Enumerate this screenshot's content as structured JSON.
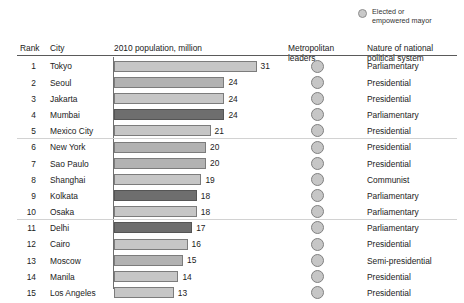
{
  "legend": {
    "icon": "filled-circle-icon",
    "label": "Elected or\nempowered mayor",
    "swatch_color": "#c9c9c9"
  },
  "header": {
    "rank": "Rank",
    "city": "City",
    "population": "2010 population, million",
    "metropolitan_leaders": "Metropolitan\nleaders",
    "political_system": "Nature of national\npolitical system"
  },
  "colors": {
    "bar_light": "#c6c6c6",
    "bar_medium": "#b2b2b2",
    "bar_dark": "#6e6e6e",
    "rule": "#5a5a5a",
    "separator": "#d2d2d2"
  },
  "chart_data": {
    "type": "bar",
    "title": "2010 population, million",
    "xlabel": "",
    "ylabel": "",
    "orientation": "horizontal",
    "grid": false,
    "xlim": [
      0,
      31
    ],
    "px_per_unit": 4.6,
    "categories": [
      "Tokyo",
      "Seoul",
      "Jakarta",
      "Mumbai",
      "Mexico City",
      "New York",
      "Sao Paulo",
      "Shanghai",
      "Kolkata",
      "Osaka",
      "Delhi",
      "Cairo",
      "Moscow",
      "Manila",
      "Los Angeles"
    ],
    "values": [
      31,
      24,
      24,
      24,
      21,
      20,
      20,
      19,
      18,
      18,
      17,
      16,
      15,
      14,
      13
    ],
    "legend": [
      "Elected or empowered mayor"
    ]
  },
  "rows": [
    {
      "rank": "1",
      "city": "Tokyo",
      "value": 31,
      "value_label": "31",
      "shade": "light",
      "leader": true,
      "system": "Parliamentary"
    },
    {
      "rank": "2",
      "city": "Seoul",
      "value": 24,
      "value_label": "24",
      "shade": "medium",
      "leader": true,
      "system": "Presidential"
    },
    {
      "rank": "3",
      "city": "Jakarta",
      "value": 24,
      "value_label": "24",
      "shade": "light",
      "leader": true,
      "system": "Presidential"
    },
    {
      "rank": "4",
      "city": "Mumbai",
      "value": 24,
      "value_label": "24",
      "shade": "dark",
      "leader": true,
      "system": "Parliamentary"
    },
    {
      "rank": "5",
      "city": "Mexico City",
      "value": 21,
      "value_label": "21",
      "shade": "light",
      "leader": true,
      "system": "Presidential"
    },
    {
      "rank": "6",
      "city": "New York",
      "value": 20,
      "value_label": "20",
      "shade": "medium",
      "leader": true,
      "system": "Presidential"
    },
    {
      "rank": "7",
      "city": "Sao Paulo",
      "value": 20,
      "value_label": "20",
      "shade": "medium",
      "leader": true,
      "system": "Presidential"
    },
    {
      "rank": "8",
      "city": "Shanghai",
      "value": 19,
      "value_label": "19",
      "shade": "light",
      "leader": true,
      "system": "Communist"
    },
    {
      "rank": "9",
      "city": "Kolkata",
      "value": 18,
      "value_label": "18",
      "shade": "dark",
      "leader": true,
      "system": "Parliamentary"
    },
    {
      "rank": "10",
      "city": "Osaka",
      "value": 18,
      "value_label": "18",
      "shade": "light",
      "leader": true,
      "system": "Parliamentary"
    },
    {
      "rank": "11",
      "city": "Delhi",
      "value": 17,
      "value_label": "17",
      "shade": "dark",
      "leader": true,
      "system": "Parliamentary"
    },
    {
      "rank": "12",
      "city": "Cairo",
      "value": 16,
      "value_label": "16",
      "shade": "light",
      "leader": true,
      "system": "Presidential"
    },
    {
      "rank": "13",
      "city": "Moscow",
      "value": 15,
      "value_label": "15",
      "shade": "medium",
      "leader": true,
      "system": "Semi-presidential"
    },
    {
      "rank": "14",
      "city": "Manila",
      "value": 14,
      "value_label": "14",
      "shade": "light",
      "leader": true,
      "system": "Presidential"
    },
    {
      "rank": "15",
      "city": "Los Angeles",
      "value": 13,
      "value_label": "13",
      "shade": "light",
      "leader": true,
      "system": "Presidential"
    }
  ],
  "group_separators_after_row": [
    5,
    10
  ]
}
